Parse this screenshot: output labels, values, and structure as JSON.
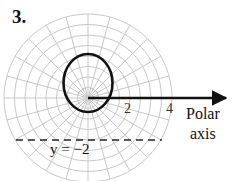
{
  "problem": {
    "number": "3."
  },
  "diagram": {
    "type": "polar_graph",
    "grid": {
      "rings": 8,
      "ring_step": 0.5,
      "max_radius": 4,
      "spokes_deg": 15,
      "color": "#c8c8c8"
    },
    "curve": {
      "description": "circle through pole, above polar axis",
      "equation_implied": "r = 3 sin θ",
      "color": "#111111"
    },
    "tick_labels": [
      "2",
      "4"
    ],
    "axis": {
      "label_line1": "Polar",
      "label_line2": "axis"
    },
    "line": {
      "label": "y = −2",
      "style": "dashed"
    }
  }
}
